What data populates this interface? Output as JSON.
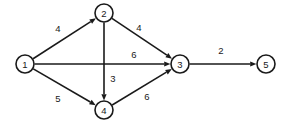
{
  "diagram": {
    "type": "directed-weighted-graph",
    "background_color": "#ffffff",
    "stroke_color": "#1a1a1a",
    "node_radius": 9,
    "nodes": [
      {
        "id": "1",
        "label": "1",
        "x": 25,
        "y": 64
      },
      {
        "id": "2",
        "label": "2",
        "x": 104,
        "y": 13
      },
      {
        "id": "3",
        "label": "3",
        "x": 180,
        "y": 64
      },
      {
        "id": "4",
        "label": "4",
        "x": 104,
        "y": 110
      },
      {
        "id": "5",
        "label": "5",
        "x": 266,
        "y": 64
      }
    ],
    "edges": [
      {
        "id": "e1",
        "from": "1",
        "to": "2",
        "weight": "4",
        "label_x": 58,
        "label_y": 28
      },
      {
        "id": "e2",
        "from": "2",
        "to": "3",
        "weight": "4",
        "label_x": 139,
        "label_y": 27
      },
      {
        "id": "e3",
        "from": "1",
        "to": "3",
        "weight": "6",
        "label_x": 134,
        "label_y": 54
      },
      {
        "id": "e4",
        "from": "2",
        "to": "4",
        "weight": "3",
        "label_x": 113,
        "label_y": 78
      },
      {
        "id": "e5",
        "from": "1",
        "to": "4",
        "weight": "5",
        "label_x": 58,
        "label_y": 98
      },
      {
        "id": "e6",
        "from": "4",
        "to": "3",
        "weight": "6",
        "label_x": 147,
        "label_y": 96
      },
      {
        "id": "e7",
        "from": "3",
        "to": "5",
        "weight": "2",
        "label_x": 221,
        "label_y": 50
      }
    ]
  }
}
